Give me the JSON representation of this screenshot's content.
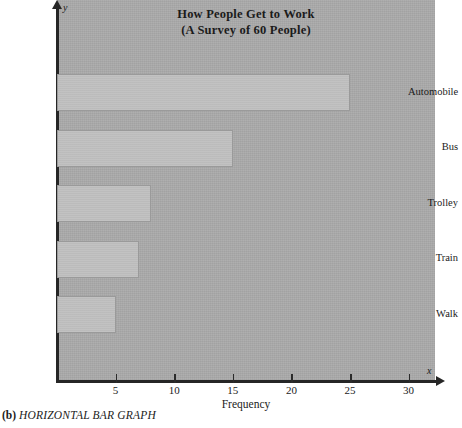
{
  "caption": {
    "index": "(b)",
    "text": "HORIZONTAL BAR GRAPH"
  },
  "axis_markers": {
    "x_letter": "x",
    "y_letter": "y"
  },
  "chart_data": {
    "type": "bar",
    "orientation": "horizontal",
    "title": "How People Get to Work",
    "subtitle": "(A Survey of 60 People)",
    "categories": [
      "Automobile",
      "Bus",
      "Trolley",
      "Train",
      "Walk"
    ],
    "values": [
      25,
      15,
      8,
      7,
      5
    ],
    "xlabel": "Frequency",
    "ylabel": "",
    "xlim": [
      0,
      33
    ],
    "xticks": [
      5,
      10,
      15,
      20,
      25,
      30
    ],
    "xtick_labels": [
      "5",
      "10",
      "15",
      "20",
      "25",
      "30"
    ],
    "grid": false,
    "legend": null,
    "colors": {
      "bar_fill": "#bfbfbf",
      "bar_edge": "#9a9a9a",
      "plot_background": "#a9a9a9",
      "page_background": "#ffffff",
      "axis": "#262626",
      "text": "#1b1b1b"
    }
  }
}
